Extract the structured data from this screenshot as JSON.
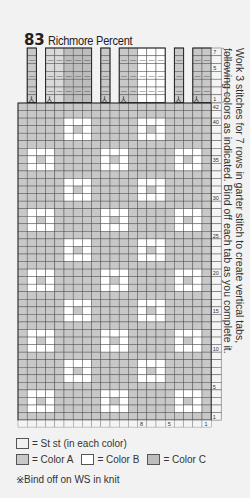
{
  "header": {
    "number": "83",
    "name": "Richmore Percent"
  },
  "side_note": {
    "line1": "Work 3 stitches for 7 rows in garter stitch to create vertical tabs,",
    "line2": "following colors as indicated. Bind off each tab as you complete it."
  },
  "colors": {
    "color_a": "#c8c8c8",
    "color_b": "#ffffff",
    "color_c": "#bdbdbd",
    "tab_light": "#d9d9d9",
    "grid_line": "#555555",
    "background": "#f2f2f2"
  },
  "chart": {
    "columns": 21,
    "body_rows": 42,
    "tab_rows": 7,
    "tab_row_labels": [
      "1",
      "5",
      "7"
    ],
    "body_row_labels": [
      "1",
      "5",
      "10",
      "15",
      "20",
      "25",
      "30",
      "35",
      "40",
      "42"
    ],
    "column_labels": [
      "1",
      "5",
      "8"
    ],
    "tabs": [
      {
        "cols": [
          2
        ],
        "color": "A"
      },
      {
        "cols": [
          4,
          5,
          6,
          7,
          8
        ],
        "color": "mixed"
      },
      {
        "cols": [
          10
        ],
        "color": "A"
      },
      {
        "cols": [
          12,
          13,
          14,
          15,
          16
        ],
        "color": "mixed-B"
      },
      {
        "cols": [
          18
        ],
        "color": "A"
      },
      {
        "cols": [
          20,
          21
        ],
        "color": "A"
      }
    ],
    "bind_off_symbol": "⅄",
    "garter_symbol": "—"
  },
  "legend": {
    "st_st": "= St st (in each color)",
    "color_a": "= Color A",
    "color_b": "= Color B",
    "color_c": "= Color C",
    "note": "※Bind off on WS in knit"
  }
}
